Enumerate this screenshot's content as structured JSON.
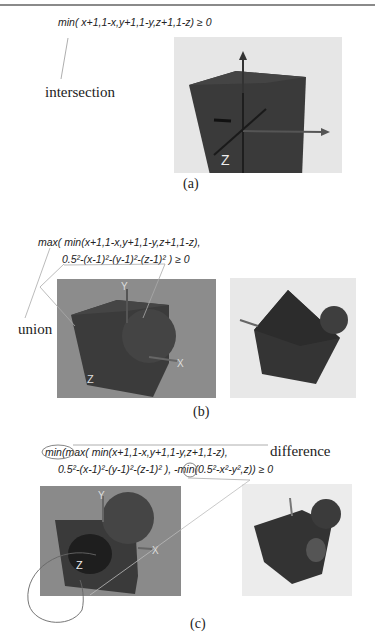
{
  "figure": {
    "panel_a": {
      "formula": "min( x+1,1-x,y+1,1-y,z+1,1-z) ≥ 0",
      "annotation": "intersection",
      "caption": "(a)",
      "axis_label": "Z"
    },
    "panel_b": {
      "formula_line1": "max( min(x+1,1-x,y+1,1-y,z+1,1-z),",
      "formula_line2": "0.5²-(x-1)²-(y-1)²-(z-1)²  )  ≥  0",
      "annotation": "union",
      "caption": "(b)",
      "axis_labels": [
        "Y",
        "X",
        "Z"
      ]
    },
    "panel_c": {
      "formula_line1": "min(max( min(x+1,1-x,y+1,1-y,z+1,1-z),",
      "formula_line2": "0.5²-(x-1)²-(y-1)²-(z-1)²  ), -min(0.5²-x²-y²,z))  ≥  0",
      "annotation": "difference",
      "caption": "(c)",
      "axis_labels": [
        "Y",
        "X",
        "Z"
      ]
    }
  }
}
